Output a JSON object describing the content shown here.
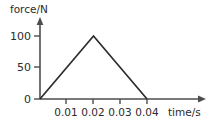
{
  "chart_data": {
    "type": "line",
    "title": "",
    "subtitle": "",
    "xlabel": "time/s",
    "ylabel": "force/N",
    "xlim": [
      0,
      0.046
    ],
    "ylim": [
      0,
      118
    ],
    "grid": false,
    "legend": null,
    "x": [
      0,
      0.02,
      0.04
    ],
    "values": [
      0,
      100,
      0
    ],
    "series": [
      {
        "name": "force",
        "x": [
          0,
          0.02,
          0.04
        ],
        "values": [
          0,
          100,
          0
        ],
        "color": "#2b2b2b"
      }
    ],
    "xticks": [
      {
        "value": 0.01,
        "label": "0.01"
      },
      {
        "value": 0.02,
        "label": "0.02"
      },
      {
        "value": 0.03,
        "label": "0.03"
      },
      {
        "value": 0.04,
        "label": "0.04"
      }
    ],
    "yticks": [
      {
        "value": 0,
        "label": "0"
      },
      {
        "value": 50,
        "label": "50"
      },
      {
        "value": 100,
        "label": "100"
      }
    ],
    "annotations": []
  },
  "labels": {
    "y_axis_title": "force/N",
    "x_axis_title": "time/s",
    "y_tick_0": "0",
    "y_tick_50": "50",
    "y_tick_100": "100",
    "x_tick_1": "0.01",
    "x_tick_2": "0.02",
    "x_tick_3": "0.03",
    "x_tick_4": "0.04"
  },
  "colors": {
    "background": "#ffffff",
    "axis": "#4d4d4d",
    "series": "#2b2b2b",
    "text": "#2b2b2b"
  }
}
